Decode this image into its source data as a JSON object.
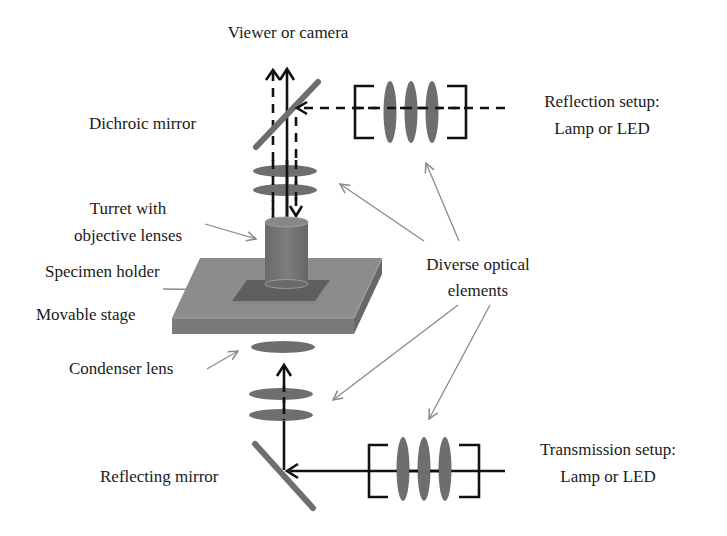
{
  "labels": {
    "viewer": "Viewer or camera",
    "dichroic_mirror": "Dichroic mirror",
    "reflection_setup_line1": "Reflection setup:",
    "reflection_setup_line2": "Lamp or LED",
    "turret_line1": "Turret with",
    "turret_line2": "objective lenses",
    "specimen_holder": "Specimen holder",
    "movable_stage": "Movable stage",
    "diverse_line1": "Diverse optical",
    "diverse_line2": "elements",
    "condenser_lens": "Condenser lens",
    "reflecting_mirror": "Reflecting mirror",
    "transmission_setup_line1": "Transmission setup:",
    "transmission_setup_line2": "Lamp or LED"
  },
  "colors": {
    "optic_gray": "#6e6e6e",
    "stage_top": "#8c8c8c",
    "stage_side": "#747474",
    "ray": "#111111",
    "pointer": "#8a8a8a",
    "text": "#1a1a1a"
  }
}
